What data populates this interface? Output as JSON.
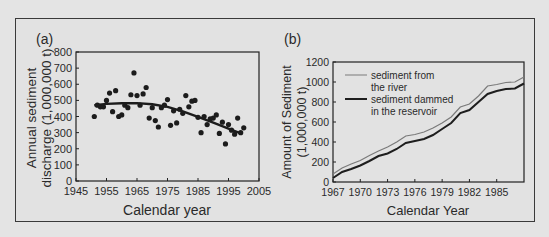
{
  "chart_data": [
    {
      "panel_label": "(a)",
      "type": "scatter",
      "title": "",
      "xlabel": "Calendar year",
      "ylabel": "Annual sediment discharge (1,000,000 t)",
      "ylabel_lines": [
        "Annual sediment",
        "discharge (1,000,000 t)"
      ],
      "xlim": [
        1945,
        2005
      ],
      "ylim": [
        0,
        800
      ],
      "xticks": [
        1945,
        1955,
        1965,
        1975,
        1985,
        1995,
        2005
      ],
      "yticks": [
        0,
        100,
        200,
        300,
        400,
        500,
        600,
        700,
        800
      ],
      "grid": false,
      "series": [
        {
          "name": "annual discharge",
          "type": "scatter",
          "points": [
            [
              1951,
              400
            ],
            [
              1952,
              470
            ],
            [
              1953,
              460
            ],
            [
              1954,
              460
            ],
            [
              1955,
              500
            ],
            [
              1956,
              545
            ],
            [
              1957,
              430
            ],
            [
              1958,
              560
            ],
            [
              1959,
              400
            ],
            [
              1960,
              410
            ],
            [
              1961,
              470
            ],
            [
              1962,
              455
            ],
            [
              1963,
              535
            ],
            [
              1964,
              670
            ],
            [
              1965,
              530
            ],
            [
              1966,
              470
            ],
            [
              1967,
              540
            ],
            [
              1968,
              580
            ],
            [
              1969,
              390
            ],
            [
              1970,
              455
            ],
            [
              1971,
              375
            ],
            [
              1972,
              335
            ],
            [
              1973,
              455
            ],
            [
              1974,
              470
            ],
            [
              1975,
              505
            ],
            [
              1976,
              345
            ],
            [
              1977,
              435
            ],
            [
              1978,
              360
            ],
            [
              1979,
              445
            ],
            [
              1980,
              420
            ],
            [
              1981,
              530
            ],
            [
              1982,
              460
            ],
            [
              1983,
              495
            ],
            [
              1984,
              500
            ],
            [
              1985,
              395
            ],
            [
              1986,
              300
            ],
            [
              1987,
              400
            ],
            [
              1988,
              350
            ],
            [
              1989,
              385
            ],
            [
              1990,
              390
            ],
            [
              1991,
              410
            ],
            [
              1992,
              295
            ],
            [
              1993,
              365
            ],
            [
              1994,
              230
            ],
            [
              1995,
              350
            ],
            [
              1996,
              315
            ],
            [
              1997,
              290
            ],
            [
              1998,
              390
            ],
            [
              1999,
              300
            ],
            [
              2000,
              330
            ]
          ]
        },
        {
          "name": "trend",
          "type": "line",
          "points": [
            [
              1951,
              470
            ],
            [
              1955,
              478
            ],
            [
              1960,
              482
            ],
            [
              1965,
              483
            ],
            [
              1970,
              476
            ],
            [
              1975,
              460
            ],
            [
              1980,
              432
            ],
            [
              1985,
              398
            ],
            [
              1990,
              362
            ],
            [
              1995,
              325
            ],
            [
              1999,
              296
            ]
          ]
        }
      ]
    },
    {
      "panel_label": "(b)",
      "type": "line",
      "title": "",
      "xlabel": "Calendar Year",
      "ylabel": "Amount of Sediment (1,000,000 t)",
      "ylabel_lines": [
        "Amount of  Sediment",
        "(1,000,000 t)"
      ],
      "xlim": [
        1967,
        1988
      ],
      "ylim": [
        0,
        1200
      ],
      "xticks": [
        1967,
        1970,
        1973,
        1976,
        1979,
        1982,
        1985
      ],
      "yticks": [
        0,
        200,
        400,
        600,
        800,
        1000,
        1200
      ],
      "grid": false,
      "legend_position": "upper left",
      "categories": [
        1967,
        1968,
        1969,
        1970,
        1971,
        1972,
        1973,
        1974,
        1975,
        1976,
        1977,
        1978,
        1979,
        1980,
        1981,
        1982,
        1983,
        1984,
        1985,
        1986,
        1987,
        1988
      ],
      "series": [
        {
          "name": "sediment from the river",
          "legend_lines": [
            "sediment from",
            "the river"
          ],
          "color": "#7a7a7a",
          "values": [
            80,
            140,
            180,
            215,
            265,
            310,
            350,
            400,
            460,
            475,
            500,
            540,
            590,
            650,
            750,
            780,
            860,
            960,
            975,
            995,
            1000,
            1050
          ]
        },
        {
          "name": "sediment dammed in the reservoir",
          "legend_lines": [
            "sediment dammed",
            "in the reservoir"
          ],
          "color": "#1e1e1e",
          "values": [
            40,
            100,
            130,
            165,
            210,
            260,
            285,
            330,
            390,
            410,
            430,
            470,
            530,
            590,
            690,
            720,
            800,
            880,
            910,
            930,
            935,
            985
          ]
        }
      ]
    }
  ]
}
